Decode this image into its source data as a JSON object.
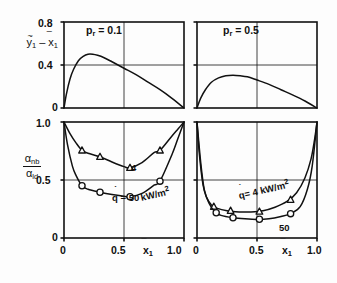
{
  "figure": {
    "title": "",
    "panels": [
      {
        "id": "top-left",
        "annotation": "p_r = 0.1",
        "annotation_parts": {
          "symbol": "p",
          "subscript": "r",
          "equals": "=",
          "value": "0.1"
        }
      },
      {
        "id": "top-right",
        "annotation": "p_r = 0.5",
        "annotation_parts": {
          "symbol": "p",
          "subscript": "r",
          "equals": "=",
          "value": "0.5"
        }
      }
    ]
  },
  "axes": {
    "top_ylabel": {
      "first": "y",
      "first_sub": "1",
      "minus": "–",
      "second": "x",
      "second_sub": "1"
    },
    "bottom_ylabel": {
      "num": "α",
      "num_sub": "nb",
      "den": "α",
      "den_sub": "ld"
    },
    "xlabel": {
      "symbol": "x",
      "subscript": "1"
    },
    "top_yticks": [
      "0.8",
      "0.4",
      "0"
    ],
    "bottom_yticks": [
      "1.0",
      "0.5",
      "0"
    ],
    "xticks": [
      "0",
      "0.5",
      "1.0"
    ]
  },
  "curve_labels": {
    "bottom_left_circle": {
      "q": "q",
      "eq": "= 50",
      "unit": "kW/m",
      "exp": "2"
    },
    "bottom_left_triangle": "4",
    "bottom_right_triangle": {
      "q": "q",
      "eq": "= 4",
      "unit": "kW/m",
      "exp": "2"
    },
    "bottom_right_circle": "50"
  },
  "chart_data": [
    {
      "type": "line",
      "id": "top-left",
      "title": "p_r = 0.1",
      "xlabel": "x̅1",
      "ylabel": "y̅1 – x̅1",
      "xlim": [
        0,
        1
      ],
      "ylim": [
        0,
        0.8
      ],
      "xticks": [
        0,
        0.5,
        1.0
      ],
      "yticks": [
        0,
        0.4,
        0.8
      ],
      "grid": true,
      "legend": "none",
      "series": [
        {
          "name": "vapour-liquid composition difference, pr=0.1",
          "x": [
            0.0,
            0.02,
            0.05,
            0.08,
            0.12,
            0.16,
            0.2,
            0.24,
            0.28,
            0.33,
            0.4,
            0.5,
            0.6,
            0.7,
            0.8,
            0.9,
            1.0
          ],
          "y": [
            0.0,
            0.13,
            0.27,
            0.36,
            0.44,
            0.48,
            0.5,
            0.5,
            0.49,
            0.47,
            0.43,
            0.37,
            0.31,
            0.24,
            0.17,
            0.09,
            0.0
          ]
        }
      ]
    },
    {
      "type": "line",
      "id": "top-right",
      "title": "p_r = 0.5",
      "xlabel": "x̅1",
      "ylabel": "y̅1 – x̅1",
      "xlim": [
        0,
        1
      ],
      "ylim": [
        0,
        0.8
      ],
      "xticks": [
        0,
        0.5,
        1.0
      ],
      "yticks": [
        0,
        0.4,
        0.8
      ],
      "grid": true,
      "legend": "none",
      "series": [
        {
          "name": "vapour-liquid composition difference, pr=0.5",
          "x": [
            0.0,
            0.03,
            0.07,
            0.12,
            0.18,
            0.24,
            0.3,
            0.36,
            0.42,
            0.5,
            0.6,
            0.7,
            0.8,
            0.9,
            1.0
          ],
          "y": [
            0.0,
            0.09,
            0.17,
            0.24,
            0.28,
            0.3,
            0.305,
            0.3,
            0.29,
            0.26,
            0.22,
            0.17,
            0.12,
            0.065,
            0.0
          ]
        }
      ]
    },
    {
      "type": "line",
      "id": "bottom-left",
      "title": "",
      "xlabel": "x̅1",
      "ylabel": "αnb/αld",
      "xlim": [
        0,
        1
      ],
      "ylim": [
        0,
        1.0
      ],
      "xticks": [
        0,
        0.5,
        1.0
      ],
      "yticks": [
        0,
        0.5,
        1.0
      ],
      "grid": true,
      "legend": "none",
      "series": [
        {
          "name": "q = 4 kW/m2",
          "marker": "triangle",
          "x": [
            0.0,
            0.05,
            0.1,
            0.15,
            0.2,
            0.3,
            0.4,
            0.5,
            0.55,
            0.65,
            0.75,
            0.8,
            0.9,
            0.95,
            1.0
          ],
          "y": [
            1.0,
            0.9,
            0.82,
            0.755,
            0.73,
            0.7,
            0.655,
            0.615,
            0.605,
            0.65,
            0.735,
            0.755,
            0.88,
            0.94,
            1.0
          ],
          "markers_x": [
            0.15,
            0.3,
            0.55,
            0.8
          ],
          "markers_y": [
            0.755,
            0.7,
            0.605,
            0.755
          ]
        },
        {
          "name": "q = 50 kW/m2",
          "marker": "circle",
          "x": [
            0.0,
            0.03,
            0.07,
            0.1,
            0.15,
            0.2,
            0.3,
            0.4,
            0.5,
            0.55,
            0.65,
            0.75,
            0.8,
            0.9,
            0.95,
            1.0
          ],
          "y": [
            1.0,
            0.8,
            0.62,
            0.54,
            0.45,
            0.42,
            0.395,
            0.375,
            0.36,
            0.355,
            0.385,
            0.455,
            0.49,
            0.72,
            0.86,
            1.0
          ],
          "markers_x": [
            0.15,
            0.3,
            0.55,
            0.8
          ],
          "markers_y": [
            0.45,
            0.395,
            0.355,
            0.49
          ]
        }
      ]
    },
    {
      "type": "line",
      "id": "bottom-right",
      "title": "",
      "xlabel": "x̅1",
      "ylabel": "αnb/αld",
      "xlim": [
        0,
        1
      ],
      "ylim": [
        0,
        1.0
      ],
      "xticks": [
        0,
        0.5,
        1.0
      ],
      "yticks": [
        0,
        0.5,
        1.0
      ],
      "grid": true,
      "legend": "none",
      "series": [
        {
          "name": "q = 4 kW/m2",
          "marker": "triangle",
          "x": [
            0.0,
            0.02,
            0.05,
            0.08,
            0.12,
            0.17,
            0.25,
            0.35,
            0.45,
            0.55,
            0.65,
            0.75,
            0.83,
            0.9,
            0.95,
            0.98,
            1.0
          ],
          "y": [
            1.0,
            0.72,
            0.46,
            0.35,
            0.285,
            0.255,
            0.235,
            0.225,
            0.225,
            0.235,
            0.265,
            0.315,
            0.39,
            0.52,
            0.68,
            0.85,
            1.0
          ],
          "markers_x": [
            0.14,
            0.28,
            0.52,
            0.78
          ],
          "markers_y": [
            0.27,
            0.235,
            0.228,
            0.33
          ]
        },
        {
          "name": "q = 50 kW/m2",
          "marker": "circle",
          "x": [
            0.0,
            0.03,
            0.06,
            0.1,
            0.15,
            0.2,
            0.3,
            0.4,
            0.5,
            0.6,
            0.7,
            0.78,
            0.86,
            0.92,
            0.96,
            1.0
          ],
          "y": [
            1.0,
            0.66,
            0.42,
            0.3,
            0.225,
            0.195,
            0.175,
            0.165,
            0.16,
            0.165,
            0.185,
            0.21,
            0.27,
            0.42,
            0.62,
            1.0
          ],
          "markers_x": [
            0.16,
            0.3,
            0.52,
            0.78
          ],
          "markers_y": [
            0.218,
            0.175,
            0.162,
            0.21
          ]
        }
      ]
    }
  ]
}
